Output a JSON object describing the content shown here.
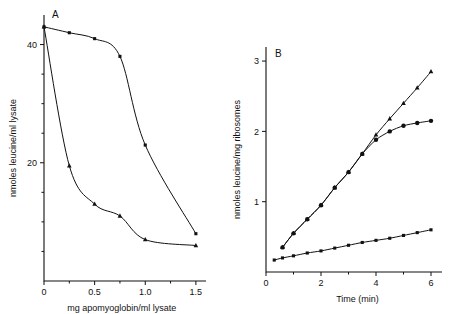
{
  "figure": {
    "panels": [
      "A",
      "B"
    ]
  },
  "chart_data": [
    {
      "panel_label": "A",
      "type": "line",
      "title": "",
      "xlabel": "mg apomyoglobin/ml lysate",
      "ylabel": "nmoles leucine/ml lysate",
      "xlim": [
        0,
        1.6
      ],
      "ylim": [
        0,
        45
      ],
      "xticks": [
        0,
        0.5,
        1.0,
        1.5
      ],
      "xticklabels": [
        "0",
        "0.5",
        "1.0",
        "1.5"
      ],
      "xminorticks": [
        0.25,
        0.75,
        1.25
      ],
      "yticks": [
        20,
        40
      ],
      "yticklabels": [
        "20",
        "40"
      ],
      "yminorticks": [
        5,
        10,
        15,
        25,
        30,
        35
      ],
      "grid": false,
      "legend": "none",
      "series": [
        {
          "name": "sigmoidal-curve",
          "marker": "square",
          "x": [
            0.0,
            0.25,
            0.5,
            0.75,
            1.0,
            1.5
          ],
          "y": [
            43.0,
            42.0,
            41.0,
            38.0,
            23.0,
            8.0
          ]
        },
        {
          "name": "hyperbolic-curve",
          "marker": "triangle",
          "x": [
            0.0,
            0.25,
            0.5,
            0.75,
            1.0,
            1.5
          ],
          "y": [
            43.0,
            19.5,
            13.0,
            11.0,
            7.0,
            6.0
          ]
        }
      ]
    },
    {
      "panel_label": "B",
      "type": "line",
      "title": "",
      "xlabel": "Time (min)",
      "ylabel": "nmoles leucine/mg ribosomes",
      "xlim": [
        0,
        6.4
      ],
      "ylim": [
        0,
        3.2
      ],
      "xticks": [
        0,
        2,
        4,
        6
      ],
      "xticklabels": [
        "0",
        "2",
        "4",
        "6"
      ],
      "xminorticks": [
        1,
        3,
        5
      ],
      "yticks": [
        1,
        2,
        3
      ],
      "yticklabels": [
        "1",
        "2",
        "3"
      ],
      "grid": false,
      "legend": "none",
      "series": [
        {
          "name": "linear-series",
          "marker": "triangle",
          "x": [
            0.6,
            1.0,
            1.5,
            2.0,
            2.5,
            3.0,
            3.5,
            4.0,
            4.5,
            5.0,
            5.5,
            6.0
          ],
          "y": [
            0.35,
            0.55,
            0.75,
            0.95,
            1.2,
            1.42,
            1.68,
            1.95,
            2.18,
            2.4,
            2.62,
            2.85
          ]
        },
        {
          "name": "saturating-series",
          "marker": "circle",
          "x": [
            0.6,
            1.0,
            1.5,
            2.0,
            2.5,
            3.0,
            3.5,
            4.0,
            4.5,
            5.0,
            5.5,
            6.0
          ],
          "y": [
            0.35,
            0.55,
            0.75,
            0.95,
            1.2,
            1.42,
            1.68,
            1.88,
            2.0,
            2.08,
            2.12,
            2.15
          ]
        },
        {
          "name": "shallow-series",
          "marker": "square",
          "x": [
            0.3,
            0.6,
            1.0,
            1.5,
            2.0,
            2.5,
            3.0,
            3.5,
            4.0,
            4.5,
            5.0,
            5.5,
            6.0
          ],
          "y": [
            0.17,
            0.2,
            0.23,
            0.27,
            0.3,
            0.34,
            0.38,
            0.42,
            0.45,
            0.48,
            0.52,
            0.56,
            0.6
          ]
        }
      ]
    }
  ]
}
